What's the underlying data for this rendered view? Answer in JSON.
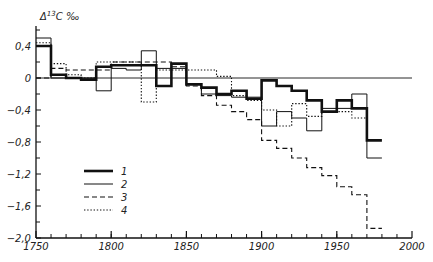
{
  "chart_data": {
    "type": "line",
    "style": "step",
    "title": "",
    "xlabel": "",
    "ylabel": "Δ13C ‰",
    "xlim": [
      1750,
      2000
    ],
    "ylim": [
      -2.0,
      0.6
    ],
    "grid": false,
    "zero_line": true,
    "x_ticks": [
      1750,
      1800,
      1850,
      1900,
      1950,
      2000
    ],
    "x_minor_step": 10,
    "y_ticks": [
      0.4,
      0,
      -0.4,
      -0.8,
      -1.2,
      -1.6,
      -2.0
    ],
    "y_tick_labels": [
      "0,4",
      "0",
      "−0,4",
      "−0,8",
      "−1,2",
      "−1,6",
      "−2,0"
    ],
    "legend_position": "lower-left",
    "series": [
      {
        "name": "1",
        "line": "thick",
        "x_edges": [
          1750,
          1760,
          1770,
          1780,
          1790,
          1800,
          1810,
          1820,
          1830,
          1840,
          1850,
          1860,
          1870,
          1880,
          1890,
          1900,
          1910,
          1920,
          1930,
          1940,
          1950,
          1960,
          1970,
          1980
        ],
        "values": [
          0.4,
          0.04,
          0.0,
          -0.02,
          0.14,
          0.16,
          0.16,
          0.16,
          -0.1,
          0.18,
          -0.08,
          -0.12,
          -0.2,
          -0.16,
          -0.26,
          -0.03,
          -0.1,
          -0.16,
          -0.28,
          -0.42,
          -0.28,
          -0.38,
          -0.78
        ]
      },
      {
        "name": "2",
        "line": "thin",
        "x_edges": [
          1750,
          1760,
          1770,
          1780,
          1790,
          1800,
          1810,
          1820,
          1830,
          1840,
          1850,
          1860,
          1870,
          1880,
          1890,
          1900,
          1910,
          1920,
          1930,
          1940,
          1950,
          1960,
          1970,
          1980
        ],
        "values": [
          0.5,
          0.0,
          0.0,
          0.0,
          -0.16,
          0.12,
          0.1,
          0.34,
          0.12,
          0.12,
          -0.08,
          -0.2,
          -0.22,
          -0.24,
          -0.24,
          -0.6,
          -0.42,
          -0.5,
          -0.66,
          -0.38,
          -0.38,
          -0.2,
          -1.0
        ]
      },
      {
        "name": "3",
        "line": "dashed",
        "x_edges": [
          1750,
          1760,
          1770,
          1780,
          1790,
          1800,
          1810,
          1820,
          1830,
          1840,
          1850,
          1860,
          1870,
          1880,
          1890,
          1900,
          1910,
          1920,
          1930,
          1940,
          1950,
          1960,
          1970,
          1980
        ],
        "values": [
          0.0,
          0.12,
          0.1,
          0.1,
          0.1,
          0.2,
          0.2,
          0.2,
          0.2,
          0.14,
          -0.1,
          -0.22,
          -0.34,
          -0.42,
          -0.52,
          -0.78,
          -0.88,
          -1.0,
          -1.12,
          -1.22,
          -1.36,
          -1.46,
          -1.88
        ]
      },
      {
        "name": "4",
        "line": "dotted",
        "x_edges": [
          1750,
          1760,
          1770,
          1780,
          1790,
          1800,
          1810,
          1820,
          1830,
          1840,
          1850,
          1860,
          1870,
          1880,
          1890,
          1900,
          1910,
          1920,
          1930,
          1940,
          1950,
          1960,
          1970
        ],
        "values": [
          0.44,
          0.18,
          0.04,
          0.0,
          0.2,
          0.2,
          0.2,
          -0.3,
          0.1,
          0.1,
          0.1,
          0.1,
          0.02,
          -0.22,
          -0.28,
          -0.4,
          -0.6,
          -0.32,
          -0.48,
          -0.42,
          -0.42,
          -0.5
        ]
      }
    ]
  },
  "axes": {
    "ylabel_text": "Δ",
    "ylabel_sup": "13",
    "ylabel_rest": "C ‰"
  },
  "legend": {
    "items": [
      {
        "label": "1"
      },
      {
        "label": "2"
      },
      {
        "label": "3"
      },
      {
        "label": "4"
      }
    ]
  }
}
